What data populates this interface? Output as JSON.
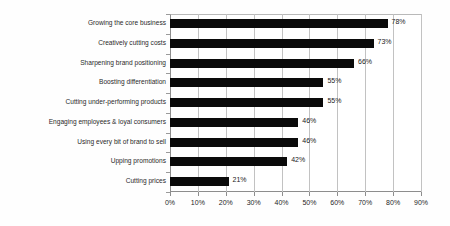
{
  "chart_data": {
    "type": "bar",
    "orientation": "horizontal",
    "title": "",
    "subtitle": "",
    "xlabel": "",
    "ylabel": "",
    "categories": [
      "Growing the core business",
      "Creatively cutting costs",
      "Sharpening brand positioning",
      "Boosting differentiation",
      "Cutting under-performing products",
      "Engaging employees & loyal consumers",
      "Using every bit of brand to sell",
      "Upping promotions",
      "Cutting prices"
    ],
    "values": [
      78,
      73,
      66,
      55,
      55,
      46,
      46,
      42,
      21
    ],
    "value_labels": [
      "78%",
      "73%",
      "66%",
      "55%",
      "55%",
      "46%",
      "46%",
      "42%",
      "21%"
    ],
    "xlim": [
      0,
      90
    ],
    "xticks": [
      0,
      10,
      20,
      30,
      40,
      50,
      60,
      70,
      80,
      90
    ],
    "xtick_labels": [
      "0%",
      "10%",
      "20%",
      "30%",
      "40%",
      "50%",
      "60%",
      "70%",
      "80%",
      "90%"
    ],
    "grid": true,
    "grid_axis": "x",
    "legend": false,
    "legend_position": "none",
    "bar_color": "#0a0a0a",
    "gridline_color": "#c2c2c2",
    "axis_color": "#8d8d8d",
    "background_color": "#ffffff"
  }
}
